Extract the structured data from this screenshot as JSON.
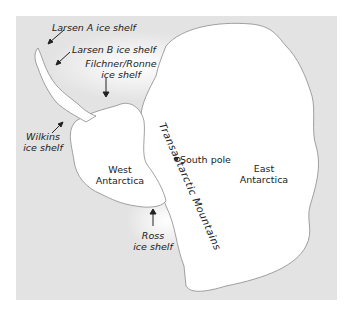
{
  "map": {
    "background_color": "#e3e3e3",
    "land_color": "#ffffff",
    "coast_color": "#8a8a8a",
    "labels": {
      "larsen_a": "Larsen A ice shelf",
      "larsen_b": "Larsen B ice shelf",
      "filchner_ronne_1": "Filchner/Ronne",
      "filchner_ronne_2": "ice shelf",
      "wilkins_1": "Wilkins",
      "wilkins_2": "ice shelf",
      "west_1": "West",
      "west_2": "Antarctica",
      "east_1": "East",
      "east_2": "Antarctica",
      "south_pole": "South pole",
      "ross_1": "Ross",
      "ross_2": "ice shelf",
      "transantarctic": "Transantarctic Mountains"
    }
  }
}
